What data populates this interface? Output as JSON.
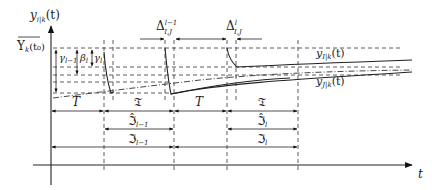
{
  "diagram": {
    "type": "timing-diagram",
    "y_axis_label": "y_{i|k}(t)",
    "y_axis_label_main": "y",
    "y_axis_label_sub": "i|k",
    "y_axis_label_arg": "(t)",
    "x_axis_label": "t",
    "y_level_label_main": "Υ",
    "y_level_label_sub": "k",
    "y_level_label_arg": "(t₀)",
    "gamma_prev_label": "γ_{l−1}",
    "gamma_prev_main": "γ",
    "gamma_prev_sub": "l−1",
    "beta_label": "β_l",
    "beta_main": "β",
    "beta_sub": "l",
    "gamma_label": "γ_l",
    "gamma_main": "γ",
    "gamma_sub": "l",
    "delta_prev_label": "Δ^{l−1}_{I,J}",
    "delta_prev_main": "Δ",
    "delta_prev_sup": "l−1",
    "delta_prev_sub": "I,J",
    "delta_label": "Δ^{l}_{I,J}",
    "delta_main": "Δ",
    "delta_sup": "l",
    "delta_sub": "I,J",
    "curve_I_label": "y_{I|k}(t)",
    "curve_I_main": "y",
    "curve_I_sub": "I|k",
    "curve_I_arg": "(t)",
    "curve_J_label": "y_{J|k}(t)",
    "curve_J_main": "y",
    "curve_J_sub": "J|k",
    "curve_J_arg": "(t)",
    "intervals_row1": [
      {
        "label": "T",
        "from": "t0",
        "to": "t1"
      },
      {
        "label": "𝔗",
        "from": "t1",
        "to": "t2"
      },
      {
        "label": "T",
        "from": "t2",
        "to": "t3"
      },
      {
        "label": "𝔗",
        "from": "t3",
        "to": "t4"
      }
    ],
    "intervals_row2": [
      {
        "label_main": "ℑ̂",
        "label_sub": "l−1",
        "from": "t1",
        "to": "t2"
      },
      {
        "label_main": "ℑ̂",
        "label_sub": "l",
        "from": "t3",
        "to": "t4"
      }
    ],
    "intervals_row3": [
      {
        "label_main": "ℑ",
        "label_sub": "l−1",
        "from": "t0",
        "to": "t2"
      },
      {
        "label_main": "ℑ",
        "label_sub": "l",
        "from": "t2",
        "to": "t4"
      }
    ],
    "row1_labels": [
      "T",
      "𝔗",
      "T",
      "𝔗"
    ],
    "row2_main": "ℑ̂",
    "row2_subs": [
      "l−1",
      "l"
    ],
    "row3_main": "ℑ",
    "row3_subs": [
      "l−1",
      "l"
    ]
  }
}
